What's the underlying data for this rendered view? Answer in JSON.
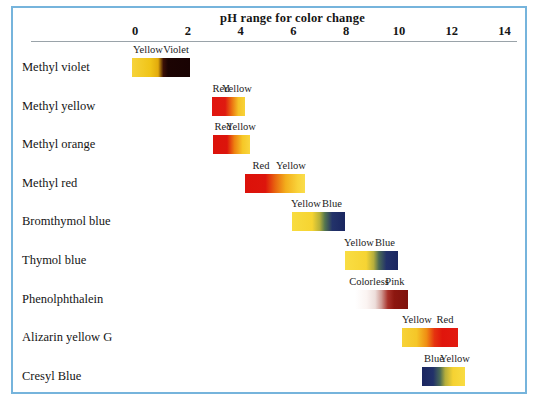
{
  "figure": {
    "title": "pH range for color change",
    "frame_color": "#76b4dc",
    "background": "#ffffff",
    "axis_rule_color": "#9aa3a9"
  },
  "axis": {
    "label": "pH",
    "ticks": [
      "0",
      "2",
      "4",
      "6",
      "8",
      "10",
      "12",
      "14"
    ],
    "tick_values": [
      0,
      2,
      4,
      6,
      8,
      10,
      12,
      14
    ],
    "range": [
      -0.5,
      14.6
    ],
    "pixel_left": 135,
    "pixel_per_unit": 26.4
  },
  "chart_data": {
    "type": "bar",
    "title": "pH range for color change",
    "xlabel": "pH",
    "ylabel": "",
    "xlim": [
      -0.5,
      14.6
    ],
    "grid": false,
    "legend": "none",
    "categories": [
      "Methyl violet",
      "Methyl yellow",
      "Methyl orange",
      "Methyl red",
      "Bromthymol blue",
      "Thymol blue",
      "Phenolphthalein",
      "Alizarin yellow G",
      "Cresyl Blue"
    ],
    "series": [
      {
        "name": "pH transition range",
        "values": [
          [
            -0.1,
            2.1
          ],
          [
            2.9,
            4.1
          ],
          [
            3.0,
            4.4
          ],
          [
            4.2,
            6.4
          ],
          [
            6.0,
            8.0
          ],
          [
            8.0,
            9.6
          ],
          [
            8.3,
            10.0
          ],
          [
            10.1,
            12.2
          ],
          [
            10.9,
            12.5
          ]
        ]
      }
    ]
  },
  "rows": [
    {
      "indicator": "Methyl violet",
      "ph_low": -0.1,
      "ph_high": 2.1,
      "bar_left_px": 132,
      "bar_width_px": 58,
      "acid_label": "Yellow",
      "base_label": "Violet",
      "acid_color": "#f2cb2b",
      "mid_color": "#e8b714",
      "base_color": "#1d0404",
      "gradient": "linear-gradient(to right, #f6d33a 0%, #f0c417 32%, #e3ab0c 45%, #3b1006 54%, #1c0403 62%, #190303 100%)"
    },
    {
      "indicator": "Methyl yellow",
      "ph_low": 2.9,
      "ph_high": 4.1,
      "bar_left_px": 212,
      "bar_width_px": 33,
      "acid_label": "Red",
      "base_label": "Yellow",
      "acid_color": "#e01a12",
      "mid_color": "#ef7b12",
      "base_color": "#f7cf33",
      "gradient": "linear-gradient(to right, #e1150f 0%, #df1a10 40%, #ec7a13 62%, #f5c227 80%, #f8d338 100%)"
    },
    {
      "indicator": "Methyl orange",
      "ph_low": 3.0,
      "ph_high": 4.4,
      "bar_left_px": 213,
      "bar_width_px": 37,
      "acid_label": "Red",
      "base_label": "Yellow",
      "acid_color": "#de140d",
      "mid_color": "#f0860f",
      "base_color": "#f8d23a",
      "gradient": "linear-gradient(to right, #dc120b 0%, #dc150c 38%, #ee8110 58%, #f6c727 80%, #f9d63e 100%)"
    },
    {
      "indicator": "Methyl red",
      "ph_low": 4.2,
      "ph_high": 6.4,
      "bar_left_px": 245,
      "bar_width_px": 60,
      "acid_label": "Red",
      "base_label": "Yellow",
      "acid_color": "#dd140c",
      "mid_color": "#ef8a11",
      "base_color": "#f9d53c",
      "gradient": "linear-gradient(to right, #dc110a 0%, #dd150c 34%, #e8640f 50%, #f3ae1c 68%, #f9d33a 88%, #fadd4b 100%)"
    },
    {
      "indicator": "Bromthymol blue",
      "ph_low": 6.0,
      "ph_high": 8.0,
      "bar_left_px": 292,
      "bar_width_px": 53,
      "acid_label": "Yellow",
      "base_label": "Blue",
      "acid_color": "#f7d839",
      "mid_color": "#8a9a3f",
      "base_color": "#1b2a63",
      "gradient": "linear-gradient(to right, #f8dc40 0%, #f6d431 38%, #b7b13a 52%, #54764f 62%, #23336a 76%, #1a2660 100%)"
    },
    {
      "indicator": "Thymol blue",
      "ph_low": 8.0,
      "ph_high": 9.6,
      "bar_left_px": 345,
      "bar_width_px": 53,
      "acid_label": "Yellow",
      "base_label": "Blue",
      "acid_color": "#f8da3c",
      "mid_color": "#7f9448",
      "base_color": "#1d2a62",
      "gradient": "linear-gradient(to right, #f9dd43 0%, #f6d433 40%, #b5ae3d 54%, #4a6a55 64%, #22316a 78%, #1b2760 100%)"
    },
    {
      "indicator": "Phenolphthalein",
      "ph_low": 8.3,
      "ph_high": 10.0,
      "bar_left_px": 355,
      "bar_width_px": 53,
      "acid_label": "Colorless",
      "base_label": "Pink",
      "acid_color": "#ffffff",
      "mid_color": "#e3c0bb",
      "base_color": "#8e1a14",
      "gradient": "linear-gradient(to right, #ffffff 0%, #fbf4f2 22%, #eddedb 38%, #cf9a93 50%, #a83129 62%, #8d1710 74%, #7e120d 100%)"
    },
    {
      "indicator": "Alizarin yellow G",
      "ph_low": 10.1,
      "ph_high": 12.2,
      "bar_left_px": 402,
      "bar_width_px": 56,
      "acid_label": "Yellow",
      "base_label": "Red",
      "acid_color": "#f6cf33",
      "mid_color": "#ef7b12",
      "base_color": "#e2140d",
      "gradient": "linear-gradient(to right, #f7d338 0%, #f5c628 26%, #ef8d13 44%, #e5330f 58%, #e0150c 72%, #e21a10 100%)"
    },
    {
      "indicator": "Cresyl Blue",
      "ph_low": 10.9,
      "ph_high": 12.5,
      "bar_left_px": 422,
      "bar_width_px": 43,
      "acid_label": "Blue",
      "base_label": "Yellow",
      "acid_color": "#1d2a62",
      "mid_color": "#7c9046",
      "base_color": "#f8d93b",
      "gradient": "linear-gradient(to right, #1b2660 0%, #22316a 26%, #4a6a55 42%, #b4ad3c 54%, #f5d232 72%, #f9dc42 100%)"
    }
  ]
}
